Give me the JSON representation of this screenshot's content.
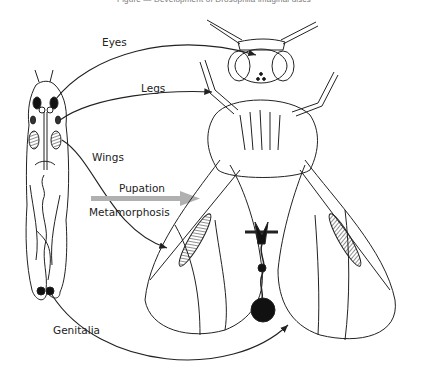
{
  "figure": {
    "title": "Figure — Development of Drosophila imaginal discs",
    "labels": {
      "eyes": "Eyes",
      "legs": "Legs",
      "wings": "Wings",
      "pupation": "Pupation",
      "metamorphosis": "Metamorphosis",
      "genitalia": "Genitalia"
    },
    "arrow_color": "#b0b0b0",
    "line_color": "#222222"
  }
}
